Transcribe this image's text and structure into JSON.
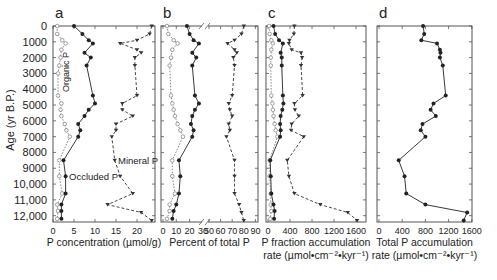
{
  "figure": {
    "y_axis_label": "Age (yr B.P.)",
    "y_ticks": [
      "0",
      "1000",
      "2000",
      "3000",
      "4000",
      "5000",
      "6000",
      "7000",
      "8000",
      "9000",
      "10,000",
      "11,000",
      "12,000"
    ],
    "panels": [
      {
        "letter": "a",
        "xlabel_line1": "P concentration (µmol/g)",
        "xlabel_line2": "",
        "x_ticks": [
          "0",
          "5",
          "10",
          "15",
          "20"
        ]
      },
      {
        "letter": "b",
        "xlabel_line1": "Percent of total P",
        "xlabel_line2": "",
        "x_ticks": [
          "0",
          "10",
          "20",
          "30",
          "50",
          "60",
          "70",
          "80",
          "90"
        ]
      },
      {
        "letter": "c",
        "xlabel_line1": "P fraction accumulation",
        "xlabel_line2": "rate (µmol•cm⁻²•kyr⁻¹)",
        "x_ticks": [
          "0",
          "400",
          "800",
          "1200",
          "1600"
        ]
      },
      {
        "letter": "d",
        "xlabel_line1": "Total P accumulation",
        "xlabel_line2": "rate (µmol•cm⁻²•kyr⁻¹)",
        "x_ticks": [
          "0",
          "400",
          "800",
          "1200",
          "1600"
        ]
      }
    ],
    "annotations": {
      "organic": "Organic P",
      "occluded": "Occluded P",
      "mineral": "Mineral P"
    }
  },
  "chart_data": [
    {
      "panel": "a",
      "type": "line",
      "orientation": "vertical-depth-profile",
      "title": "",
      "xlabel": "P concentration (µmol/g)",
      "ylabel": "Age (yr B.P.)",
      "xlim": [
        0,
        24
      ],
      "ylim": [
        12500,
        0
      ],
      "series": [
        {
          "name": "Organic P",
          "marker": "open-circle",
          "line": "dotted",
          "age": [
            0,
            500,
            900,
            1100,
            1500,
            2000,
            2500,
            3000,
            4400,
            4900,
            5300,
            5700,
            6200,
            6600,
            7000,
            8500,
            9500,
            10600,
            11300,
            11700,
            12200
          ],
          "values": [
            1,
            1,
            2.2,
            3,
            2,
            1.8,
            1.5,
            1.2,
            1.2,
            2,
            1.8,
            2,
            2.8,
            3.2,
            4,
            1.5,
            1.5,
            2.2,
            1,
            1.2,
            1
          ]
        },
        {
          "name": "Occluded P",
          "marker": "filled-circle",
          "line": "solid",
          "age": [
            0,
            500,
            900,
            1100,
            1700,
            2000,
            2500,
            4400,
            4900,
            5300,
            5700,
            6200,
            6600,
            7000,
            8500,
            9500,
            10600,
            11300,
            11700,
            12200
          ],
          "values": [
            5,
            7,
            8.5,
            9.5,
            7.5,
            9,
            8,
            9.5,
            10,
            8.5,
            7.5,
            6,
            6.5,
            6,
            2.5,
            3,
            3,
            2,
            2,
            2
          ]
        },
        {
          "name": "Mineral P",
          "marker": "filled-triangle",
          "line": "dashed",
          "age": [
            0,
            500,
            900,
            1100,
            1500,
            1700,
            2000,
            2500,
            4400,
            4900,
            5300,
            5700,
            6200,
            6600,
            7000,
            8500,
            9500,
            10600,
            11300,
            11800,
            12300
          ],
          "values": [
            23.5,
            23,
            20,
            16,
            20,
            21,
            19.5,
            19.5,
            20,
            16.5,
            16.5,
            19,
            15,
            15,
            14,
            14.7,
            16,
            19,
            13,
            21,
            23.5
          ]
        }
      ]
    },
    {
      "panel": "b",
      "type": "line",
      "orientation": "vertical-depth-profile",
      "xlabel": "Percent of total P",
      "ylabel": "Age (yr B.P.)",
      "xlim": [
        0,
        90
      ],
      "axis_break": [
        30,
        50
      ],
      "series": [
        {
          "name": "Organic P",
          "marker": "open-circle",
          "line": "dotted",
          "age": [
            0,
            500,
            900,
            1100,
            1500,
            2000,
            2500,
            4400,
            4900,
            5300,
            5700,
            6200,
            6600,
            7000,
            8500,
            9500,
            10600,
            11300,
            11700,
            12200
          ],
          "values": [
            3,
            4,
            8,
            11,
            7,
            6,
            5,
            6,
            7,
            8,
            9,
            11,
            13,
            15,
            7,
            7,
            9,
            5,
            5,
            3
          ]
        },
        {
          "name": "Occluded P",
          "marker": "filled-circle",
          "line": "solid",
          "age": [
            0,
            500,
            900,
            1100,
            1700,
            2000,
            2500,
            4400,
            4900,
            5300,
            5700,
            6200,
            6600,
            7000,
            8500,
            9500,
            10600,
            11300,
            11700,
            12200
          ],
          "values": [
            18,
            20,
            23,
            27,
            22,
            25,
            22,
            24,
            27,
            24,
            22,
            21,
            23,
            22,
            12,
            13,
            12,
            10,
            8,
            7
          ]
        },
        {
          "name": "Mineral P",
          "marker": "filled-triangle",
          "line": "dashed",
          "age": [
            0,
            500,
            900,
            1100,
            1500,
            1700,
            2000,
            2500,
            4400,
            4900,
            5300,
            5700,
            6200,
            6600,
            7000,
            8500,
            9500,
            10600,
            11300,
            11800,
            12300
          ],
          "values": [
            80,
            78,
            72,
            66,
            72,
            74,
            71,
            72,
            70,
            67,
            68,
            70,
            67,
            68,
            65,
            72,
            72,
            72,
            76,
            78,
            80
          ]
        }
      ]
    },
    {
      "panel": "c",
      "type": "line",
      "orientation": "vertical-depth-profile",
      "xlabel": "P fraction accumulation rate (µmol•cm⁻²•kyr⁻¹)",
      "ylabel": "Age (yr B.P.)",
      "xlim": [
        0,
        1800
      ],
      "series": [
        {
          "name": "Organic P",
          "marker": "open-circle",
          "line": "dotted",
          "age": [
            0,
            500,
            900,
            1100,
            1500,
            2000,
            2500,
            4400,
            4900,
            5300,
            5700,
            6200,
            6600,
            7000,
            8500,
            9500,
            10600,
            11300,
            11700,
            12200
          ],
          "values": [
            20,
            30,
            60,
            90,
            60,
            50,
            50,
            60,
            80,
            90,
            100,
            120,
            140,
            170,
            30,
            30,
            50,
            50,
            60,
            40
          ]
        },
        {
          "name": "Occluded P",
          "marker": "filled-circle",
          "line": "solid",
          "age": [
            0,
            500,
            900,
            1100,
            1700,
            2000,
            2500,
            4400,
            4900,
            5300,
            5700,
            6200,
            6600,
            7000,
            8500,
            9500,
            10600,
            11300,
            11700,
            12200
          ],
          "values": [
            100,
            130,
            200,
            270,
            230,
            250,
            250,
            270,
            280,
            260,
            230,
            220,
            230,
            220,
            40,
            50,
            60,
            100,
            120,
            110
          ]
        },
        {
          "name": "Mineral P",
          "marker": "filled-triangle",
          "line": "dashed",
          "age": [
            0,
            500,
            900,
            1100,
            1500,
            1700,
            2000,
            2500,
            4400,
            4900,
            5300,
            5700,
            6200,
            6600,
            7000,
            8500,
            9500,
            10600,
            11300,
            11800,
            12300
          ],
          "values": [
            480,
            470,
            390,
            380,
            430,
            600,
            620,
            600,
            630,
            480,
            490,
            560,
            430,
            420,
            650,
            350,
            380,
            480,
            950,
            1450,
            1620
          ]
        }
      ]
    },
    {
      "panel": "d",
      "type": "line",
      "orientation": "vertical-depth-profile",
      "xlabel": "Total P accumulation rate (µmol•cm⁻²•kyr⁻¹)",
      "ylabel": "Age (yr B.P.)",
      "xlim": [
        0,
        1800
      ],
      "series": [
        {
          "name": "Total P",
          "marker": "filled-circle",
          "line": "solid",
          "age": [
            0,
            500,
            900,
            1100,
            1500,
            1700,
            2000,
            2500,
            4400,
            4900,
            5300,
            5700,
            6200,
            6600,
            7000,
            8500,
            9500,
            10600,
            11300,
            11800,
            12300
          ],
          "values": [
            760,
            780,
            730,
            1000,
            1050,
            1060,
            1050,
            1100,
            1150,
            940,
            890,
            980,
            750,
            720,
            800,
            340,
            440,
            470,
            800,
            1520,
            1460
          ]
        }
      ]
    }
  ]
}
